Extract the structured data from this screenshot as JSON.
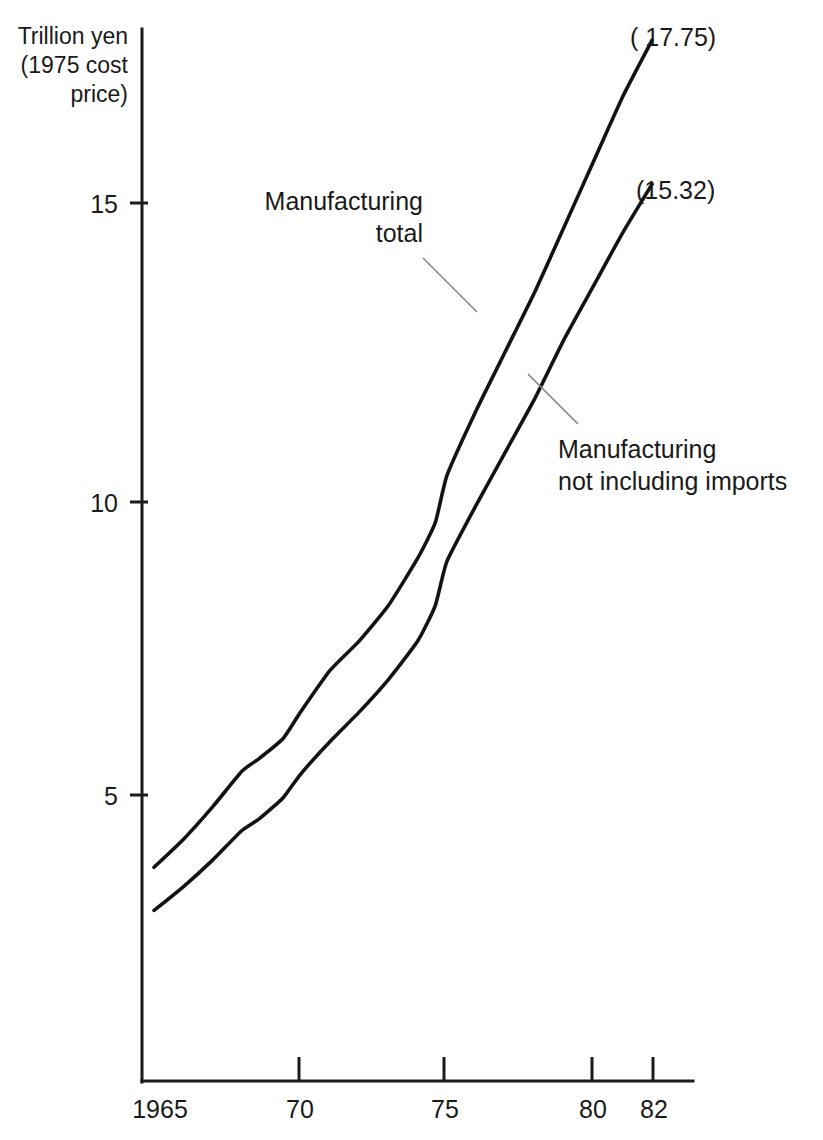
{
  "chart_data": {
    "type": "line",
    "title": "",
    "subtitle": "",
    "ylabel_lines": [
      "Trillion yen",
      "(1975 cost",
      "price)"
    ],
    "ylabel": "Trillion yen (1975 cost price)",
    "xlabel": "",
    "x_tick_labels": [
      "1965",
      "70",
      "75",
      "80",
      "82"
    ],
    "x_tick_values": [
      1965,
      1970,
      1975,
      1980,
      1982
    ],
    "y_tick_labels": [
      "5",
      "10",
      "15"
    ],
    "y_tick_values": [
      5,
      10,
      15
    ],
    "xlim": [
      1965,
      1982.5
    ],
    "ylim": [
      0,
      18.6
    ],
    "grid": false,
    "legend_position": "inline-annotations",
    "series": [
      {
        "name": "Manufacturing total",
        "label_lines": [
          "Manufacturing",
          "total"
        ],
        "end_value_label": "( 17.75)",
        "end_value": 17.75,
        "x": [
          1965,
          1966,
          1967,
          1968,
          1968.6,
          1969.4,
          1970,
          1971,
          1972,
          1973,
          1974,
          1974.6,
          1975,
          1976,
          1977,
          1978,
          1979,
          1980,
          1981,
          1982
        ],
        "values": [
          3.78,
          4.25,
          4.8,
          5.4,
          5.62,
          5.95,
          6.4,
          7.1,
          7.6,
          8.2,
          9.0,
          9.6,
          10.4,
          11.5,
          12.5,
          13.5,
          14.6,
          15.7,
          16.8,
          17.75
        ]
      },
      {
        "name": "Manufacturing not including imports",
        "label_lines": [
          "Manufacturing",
          "not including imports"
        ],
        "end_value_label": "(15.32)",
        "end_value": 15.32,
        "x": [
          1965,
          1966,
          1967,
          1968,
          1968.6,
          1969.4,
          1970,
          1971,
          1972,
          1973,
          1974,
          1974.6,
          1975,
          1976,
          1977,
          1978,
          1979,
          1980,
          1981,
          1982
        ],
        "values": [
          3.05,
          3.45,
          3.9,
          4.4,
          4.6,
          4.95,
          5.35,
          5.9,
          6.4,
          6.95,
          7.6,
          8.2,
          8.95,
          9.9,
          10.8,
          11.7,
          12.7,
          13.6,
          14.5,
          15.32
        ]
      }
    ],
    "annotations": [
      {
        "text": "Manufacturing total",
        "lines": [
          "Manufacturing",
          "total"
        ],
        "target_series": "Manufacturing total"
      },
      {
        "text": "Manufacturing not including imports",
        "lines": [
          "Manufacturing",
          "not including imports"
        ],
        "target_series": "Manufacturing not including imports"
      }
    ],
    "colors": {
      "line": "#131313",
      "axis": "#1b1b1b",
      "leader": "#8a8a8a",
      "text": "#1a1a1a",
      "background": "#ffffff"
    }
  }
}
